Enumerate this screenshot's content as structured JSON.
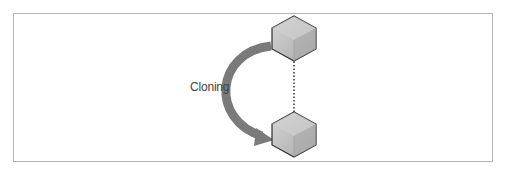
{
  "diagram": {
    "label": "Cloning",
    "nodes": [
      {
        "id": "original-cube",
        "shape": "hexagon-cube"
      },
      {
        "id": "clone-cube",
        "shape": "hexagon-cube"
      }
    ],
    "edges": [
      {
        "from": "original-cube",
        "to": "clone-cube",
        "style": "dotted-arrow"
      },
      {
        "from": "original-cube",
        "to": "clone-cube",
        "style": "curved-thick-arrow",
        "label": "Cloning"
      }
    ],
    "colors": {
      "frame": "#b3b3b3",
      "arrow": "#7a7a7a",
      "cube_top": "#d2d2d2",
      "cube_left": "#bdbdbd",
      "cube_right": "#a8a8a8",
      "cube_outline": "#2e2e2e",
      "text": "#444444"
    }
  }
}
